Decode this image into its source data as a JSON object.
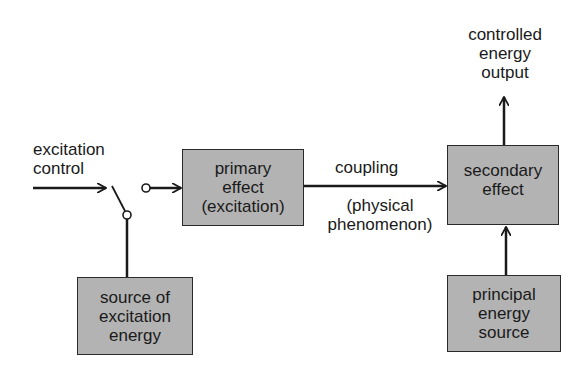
{
  "diagram": {
    "type": "block-diagram",
    "nodes": {
      "primary_effect": {
        "lines": [
          "primary",
          "effect",
          "(excitation)"
        ]
      },
      "secondary_effect": {
        "lines": [
          "secondary",
          "effect"
        ]
      },
      "source_of_excitation": {
        "lines": [
          "source of",
          "excitation",
          "energy"
        ]
      },
      "principal_source": {
        "lines": [
          "principal",
          "energy",
          "source"
        ]
      }
    },
    "labels": {
      "excitation_control": [
        "excitation",
        "control"
      ],
      "coupling": "coupling",
      "physical_phenomenon": [
        "(physical",
        "phenomenon)"
      ],
      "controlled_output": [
        "controlled",
        "energy",
        "output"
      ]
    },
    "edges": [
      {
        "from": "excitation_control",
        "to": "switch"
      },
      {
        "from": "switch",
        "to": "primary_effect"
      },
      {
        "from": "source_of_excitation",
        "to": "switch"
      },
      {
        "from": "primary_effect",
        "to": "secondary_effect",
        "label": "coupling"
      },
      {
        "from": "principal_source",
        "to": "secondary_effect"
      },
      {
        "from": "secondary_effect",
        "to": "controlled_output"
      }
    ],
    "colors": {
      "box_fill": "#b3b3b3",
      "stroke": "#1a1a1a",
      "background": "#ffffff"
    }
  }
}
